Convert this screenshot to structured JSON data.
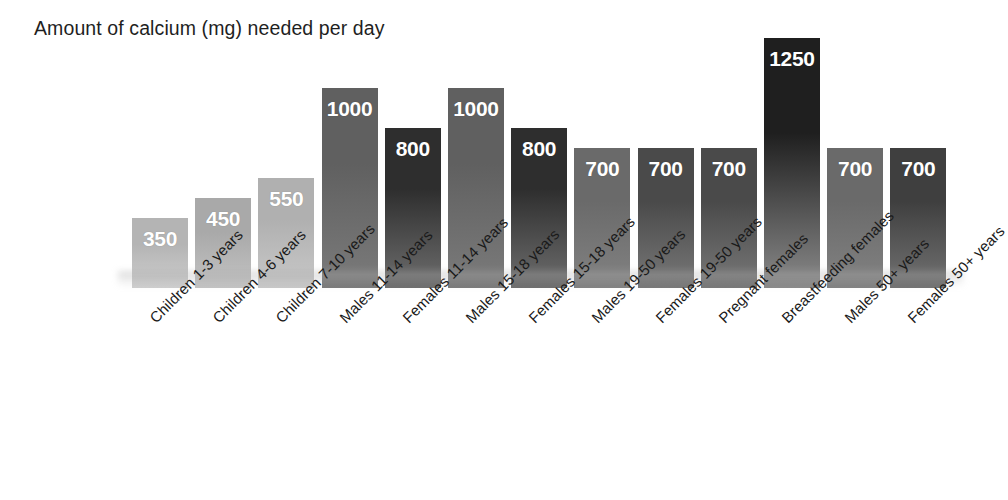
{
  "chart_data": {
    "type": "bar",
    "title": "Amount of calcium (mg) needed per day",
    "xlabel": "",
    "ylabel": "",
    "ylim": [
      0,
      1250
    ],
    "grid": false,
    "legend": "none",
    "axis_visible": false,
    "value_labels_shown": true,
    "label_rotation_degrees": -45,
    "categories": [
      "Children 1-3 years",
      "Children 4-6 years",
      "Children 7-10 years",
      "Males 11-14 years",
      "Females 11-14 years",
      "Males 15-18 years",
      "Females 15-18 years",
      "Males 19-50 years",
      "Females 19-50 years",
      "Pregnant females",
      "Breastfeeding females",
      "Males 50+ years",
      "Females 50+ years"
    ],
    "values": [
      350,
      450,
      550,
      1000,
      800,
      1000,
      800,
      700,
      700,
      700,
      1250,
      700,
      700
    ],
    "bar_colors_top": [
      "#b4b4b4",
      "#a9a9a9",
      "#b0b0b0",
      "#606060",
      "#2e2e2e",
      "#606060",
      "#2e2e2e",
      "#6a6a6a",
      "#4a4a4a",
      "#4a4a4a",
      "#1f1f1f",
      "#6a6a6a",
      "#3f3f3f"
    ],
    "bar_colors_bottom": [
      "#cfcfcf",
      "#c4c4c4",
      "#c9c9c9",
      "#7b7b7b",
      "#6e6e6e",
      "#7b7b7b",
      "#6e6e6e",
      "#828282",
      "#787878",
      "#787878",
      "#8a8a8a",
      "#828282",
      "#727272"
    ],
    "value_label_color": "#ffffff",
    "background_color": "#ffffff"
  }
}
